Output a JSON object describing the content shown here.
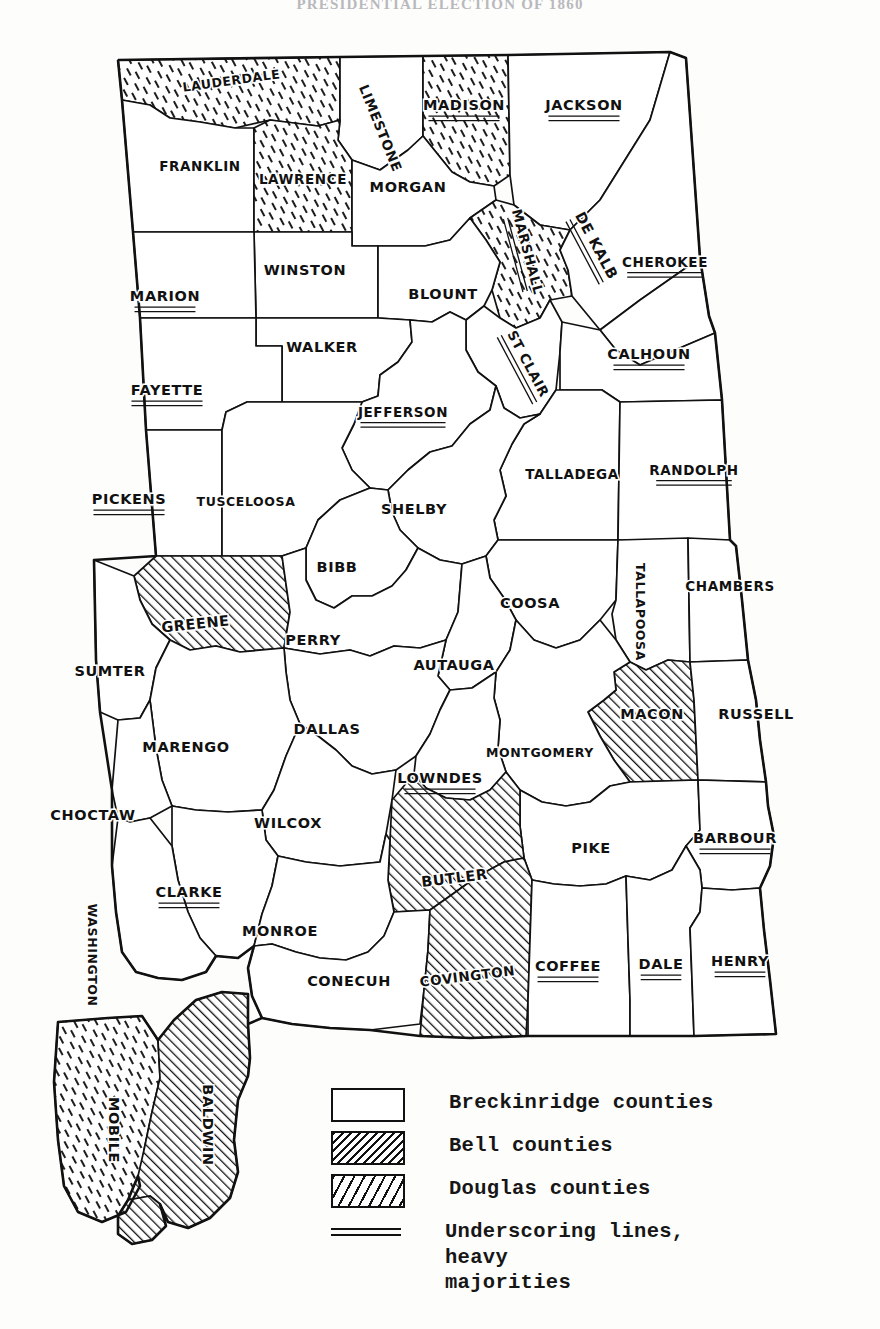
{
  "title": "PRESIDENTIAL ELECTION OF 1860",
  "map": {
    "name": "alabama-county-map-1860-presidential-election",
    "state": "Alabama",
    "categories": {
      "breckinridge": {
        "label": "Breckinridge counties",
        "fill": "white"
      },
      "bell": {
        "label": "Bell counties",
        "fill": "dense-diagonal-hatch"
      },
      "douglas": {
        "label": "Douglas counties",
        "fill": "sparse-irregular-hatch"
      }
    },
    "counties": [
      {
        "name": "LAUDERDALE",
        "party": "douglas",
        "underscored": false,
        "x": 232,
        "y": 85,
        "rotate": -8
      },
      {
        "name": "LIMESTONE",
        "party": "breckinridge",
        "underscored": false,
        "x": 376,
        "y": 130,
        "rotate": 68
      },
      {
        "name": "MADISON",
        "party": "douglas",
        "underscored": true,
        "x": 464,
        "y": 110,
        "rotate": 0
      },
      {
        "name": "JACKSON",
        "party": "breckinridge",
        "underscored": true,
        "x": 584,
        "y": 110,
        "rotate": 0
      },
      {
        "name": "FRANKLIN",
        "party": "breckinridge",
        "underscored": false,
        "x": 200,
        "y": 171,
        "rotate": 0
      },
      {
        "name": "LAWRENCE",
        "party": "douglas",
        "underscored": false,
        "x": 303,
        "y": 184,
        "rotate": 0
      },
      {
        "name": "MORGAN",
        "party": "breckinridge",
        "underscored": false,
        "x": 408,
        "y": 192,
        "rotate": 0
      },
      {
        "name": "MARSHALL",
        "party": "douglas",
        "underscored": true,
        "x": 523,
        "y": 253,
        "rotate": 75
      },
      {
        "name": "DE KALB",
        "party": "breckinridge",
        "underscored": true,
        "x": 592,
        "y": 248,
        "rotate": 62
      },
      {
        "name": "WINSTON",
        "party": "breckinridge",
        "underscored": false,
        "x": 305,
        "y": 275,
        "rotate": 0
      },
      {
        "name": "CHEROKEE",
        "party": "breckinridge",
        "underscored": true,
        "x": 665,
        "y": 267,
        "rotate": 0
      },
      {
        "name": "MARION",
        "party": "breckinridge",
        "underscored": true,
        "x": 165,
        "y": 301,
        "rotate": 0
      },
      {
        "name": "BLOUNT",
        "party": "breckinridge",
        "underscored": false,
        "x": 443,
        "y": 299,
        "rotate": 0
      },
      {
        "name": "WALKER",
        "party": "breckinridge",
        "underscored": false,
        "x": 322,
        "y": 352,
        "rotate": 0
      },
      {
        "name": "ST CLAIR",
        "party": "breckinridge",
        "underscored": true,
        "x": 524,
        "y": 366,
        "rotate": 62
      },
      {
        "name": "CALHOUN",
        "party": "breckinridge",
        "underscored": true,
        "x": 649,
        "y": 359,
        "rotate": 0
      },
      {
        "name": "FAYETTE",
        "party": "breckinridge",
        "underscored": true,
        "x": 167,
        "y": 395,
        "rotate": 0
      },
      {
        "name": "JEFFERSON",
        "party": "breckinridge",
        "underscored": true,
        "x": 403,
        "y": 417,
        "rotate": 0
      },
      {
        "name": "TALLADEGA",
        "party": "breckinridge",
        "underscored": false,
        "x": 572,
        "y": 479,
        "rotate": 0
      },
      {
        "name": "RANDOLPH",
        "party": "breckinridge",
        "underscored": true,
        "x": 694,
        "y": 475,
        "rotate": 0
      },
      {
        "name": "PICKENS",
        "party": "breckinridge",
        "underscored": true,
        "x": 129,
        "y": 504,
        "rotate": 0
      },
      {
        "name": "TUSCELOOSA",
        "party": "breckinridge",
        "underscored": false,
        "x": 246,
        "y": 506,
        "rotate": 0
      },
      {
        "name": "SHELBY",
        "party": "breckinridge",
        "underscored": false,
        "x": 414,
        "y": 514,
        "rotate": 0
      },
      {
        "name": "BIBB",
        "party": "breckinridge",
        "underscored": false,
        "x": 337,
        "y": 572,
        "rotate": 0
      },
      {
        "name": "COOSA",
        "party": "breckinridge",
        "underscored": false,
        "x": 530,
        "y": 608,
        "rotate": 0
      },
      {
        "name": "TALLAPOOSA",
        "party": "breckinridge",
        "underscored": false,
        "x": 636,
        "y": 612,
        "rotate": 90
      },
      {
        "name": "CHAMBERS",
        "party": "breckinridge",
        "underscored": false,
        "x": 730,
        "y": 591,
        "rotate": 0
      },
      {
        "name": "GREENE",
        "party": "bell",
        "underscored": false,
        "x": 196,
        "y": 629,
        "rotate": -6
      },
      {
        "name": "PERRY",
        "party": "breckinridge",
        "underscored": false,
        "x": 313,
        "y": 645,
        "rotate": 0
      },
      {
        "name": "SUMTER",
        "party": "breckinridge",
        "underscored": false,
        "x": 110,
        "y": 676,
        "rotate": 0
      },
      {
        "name": "AUTAUGA",
        "party": "breckinridge",
        "underscored": false,
        "x": 454,
        "y": 670,
        "rotate": 0
      },
      {
        "name": "MACON",
        "party": "bell",
        "underscored": false,
        "x": 652,
        "y": 719,
        "rotate": 0
      },
      {
        "name": "RUSSELL",
        "party": "breckinridge",
        "underscored": false,
        "x": 756,
        "y": 719,
        "rotate": 0
      },
      {
        "name": "DALLAS",
        "party": "breckinridge",
        "underscored": false,
        "x": 327,
        "y": 734,
        "rotate": 0
      },
      {
        "name": "MARENGO",
        "party": "breckinridge",
        "underscored": false,
        "x": 186,
        "y": 752,
        "rotate": 0
      },
      {
        "name": "MONTGOMERY",
        "party": "breckinridge",
        "underscored": false,
        "x": 540,
        "y": 757,
        "rotate": 0
      },
      {
        "name": "LOWNDES",
        "party": "breckinridge",
        "underscored": true,
        "x": 440,
        "y": 783,
        "rotate": 0
      },
      {
        "name": "CHOCTAW",
        "party": "breckinridge",
        "underscored": false,
        "x": 93,
        "y": 820,
        "rotate": 0
      },
      {
        "name": "WILCOX",
        "party": "breckinridge",
        "underscored": false,
        "x": 288,
        "y": 828,
        "rotate": 0
      },
      {
        "name": "PIKE",
        "party": "breckinridge",
        "underscored": false,
        "x": 591,
        "y": 853,
        "rotate": 0
      },
      {
        "name": "BARBOUR",
        "party": "breckinridge",
        "underscored": true,
        "x": 735,
        "y": 843,
        "rotate": 0
      },
      {
        "name": "BUTLER",
        "party": "bell",
        "underscored": false,
        "x": 455,
        "y": 883,
        "rotate": -7
      },
      {
        "name": "CLARKE",
        "party": "breckinridge",
        "underscored": true,
        "x": 189,
        "y": 897,
        "rotate": 0
      },
      {
        "name": "MONROE",
        "party": "breckinridge",
        "underscored": false,
        "x": 280,
        "y": 936,
        "rotate": 0
      },
      {
        "name": "WASHINGTON",
        "party": "breckinridge",
        "underscored": false,
        "x": 88,
        "y": 955,
        "rotate": 90
      },
      {
        "name": "CONECUH",
        "party": "breckinridge",
        "underscored": false,
        "x": 349,
        "y": 986,
        "rotate": 0
      },
      {
        "name": "COVINGTON",
        "party": "bell",
        "underscored": false,
        "x": 468,
        "y": 981,
        "rotate": -7
      },
      {
        "name": "COFFEE",
        "party": "breckinridge",
        "underscored": true,
        "x": 568,
        "y": 971,
        "rotate": 0
      },
      {
        "name": "DALE",
        "party": "breckinridge",
        "underscored": true,
        "x": 661,
        "y": 969,
        "rotate": 0
      },
      {
        "name": "HENRY",
        "party": "breckinridge",
        "underscored": true,
        "x": 740,
        "y": 966,
        "rotate": 0
      },
      {
        "name": "BALDWIN",
        "party": "bell",
        "underscored": false,
        "x": 203,
        "y": 1125,
        "rotate": 90
      },
      {
        "name": "MOBILE",
        "party": "douglas",
        "underscored": false,
        "x": 109,
        "y": 1130,
        "rotate": 90
      }
    ]
  },
  "legend": {
    "name": "map-legend",
    "items": [
      {
        "swatch": "breckinridge",
        "label": "Breckinridge counties"
      },
      {
        "swatch": "bell",
        "label": "Bell counties"
      },
      {
        "swatch": "douglas",
        "label": "Douglas counties"
      },
      {
        "swatch": "rule",
        "label": "Underscoring lines, heavy\nmajorities"
      }
    ]
  }
}
